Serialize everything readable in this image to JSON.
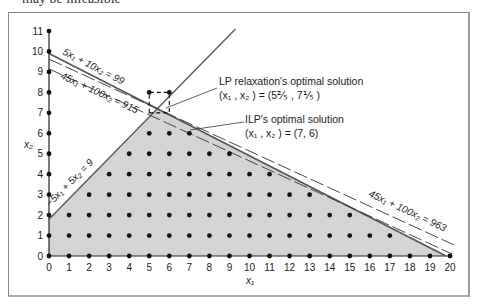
{
  "caption_cropped": "may be infeasible",
  "chart_data": {
    "type": "integer-linear-program-diagram",
    "xlabel": "x1",
    "ylabel": "x2",
    "x_ticks": [
      "0",
      "1",
      "2",
      "3",
      "4",
      "5",
      "6",
      "7",
      "8",
      "9",
      "10",
      "11",
      "12",
      "13",
      "14",
      "15",
      "16",
      "17",
      "18",
      "19",
      "20"
    ],
    "y_ticks": [
      "0",
      "1",
      "2",
      "3",
      "4",
      "5",
      "6",
      "7",
      "8",
      "9",
      "10",
      "11"
    ],
    "xlim": [
      0,
      20
    ],
    "ylim": [
      0,
      11
    ],
    "constraints": [
      {
        "label_parts": [
          "5x",
          "1",
          " + 10x",
          "2",
          " = 99"
        ],
        "a": 5,
        "b": 10,
        "c": 99,
        "style": "solid"
      },
      {
        "label_parts": [
          "−5x",
          "1",
          " + 5x",
          "2",
          " = 9"
        ],
        "a": -5,
        "b": 5,
        "c": 9,
        "style": "solid"
      }
    ],
    "objective_lines": [
      {
        "label_parts": [
          "45x",
          "1",
          " + 100x",
          "2",
          " = 915"
        ],
        "a": 45,
        "b": 100,
        "c": 915,
        "style": "dashed"
      },
      {
        "label_parts": [
          "45x",
          "1",
          " + 100x",
          "2",
          " = 963"
        ],
        "a": 45,
        "b": 100,
        "c": 963,
        "style": "dashed"
      }
    ],
    "feasible_region": [
      [
        0,
        0
      ],
      [
        0,
        1.8
      ],
      [
        5.4,
        7.2
      ],
      [
        19.8,
        0
      ]
    ],
    "annotations": [
      {
        "title": "LP relaxation's optimal solution",
        "value": "(x1, x2) = (5 2/5, 7 1/5)",
        "point": [
          5.4,
          7.2
        ]
      },
      {
        "title": "ILP's optimal solution",
        "value": "(x1, x2) = (7, 6)",
        "point": [
          7,
          6
        ]
      }
    ],
    "dashed_box": [
      [
        5,
        7
      ],
      [
        6,
        7
      ],
      [
        6,
        8
      ],
      [
        5,
        8
      ]
    ],
    "region_fill": "#d4d4d4"
  },
  "labels": {
    "c99": "5x₁ + 10x₂ = 99",
    "c915": "45x₁ + 100x₂ = 915",
    "c963": "45x₁ + 100x₂ = 963",
    "c9": "−5x₁ + 5x₂ = 9",
    "lp_title": "LP relaxation's optimal solution",
    "lp_value": "(x₁ , x₂ ) = (5⅖ , 7⅕ )",
    "ilp_title": "ILP's optimal solution",
    "ilp_value": "(x₁ , x₂ ) = (7, 6)",
    "x_axis": "x₁",
    "y_axis": "x₂"
  }
}
